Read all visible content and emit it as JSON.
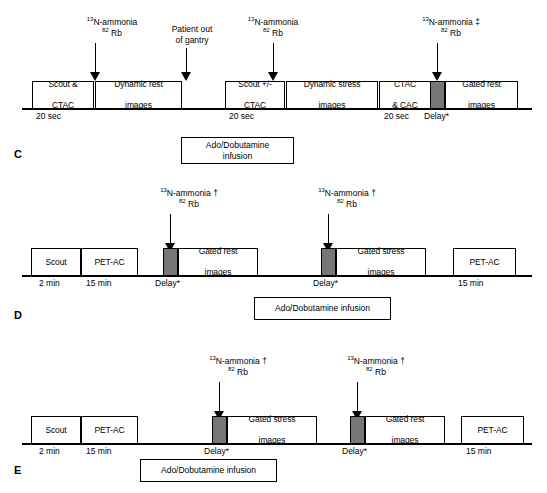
{
  "figure": {
    "panels": [
      "C",
      "D",
      "E"
    ],
    "ink_color": "#000000",
    "delay_block_color": "#767676",
    "background_color": "#ffffff"
  },
  "panel_c": {
    "letter": "C",
    "tracers": [
      {
        "id": "tracer-c1",
        "nuclide_sup": "13",
        "nuclide": "N-ammonia",
        "marker": "",
        "alt_sup": "82",
        "alt": "Rb"
      },
      {
        "id": "tracer-c2",
        "text_line1": "Patient out",
        "text_line2": "of gantry"
      },
      {
        "id": "tracer-c3",
        "nuclide_sup": "13",
        "nuclide": "N-ammonia",
        "marker": "",
        "alt_sup": "82",
        "alt": "Rb"
      },
      {
        "id": "tracer-c4",
        "nuclide_sup": "13",
        "nuclide": "N-ammonia",
        "marker": "‡",
        "alt_sup": "82",
        "alt": "Rb"
      }
    ],
    "steps": [
      {
        "id": "step-c-scout-ctac",
        "line1": "Scout &",
        "line2": "CTAC"
      },
      {
        "id": "step-c-dynamic-rest",
        "line1": "Dynamic rest",
        "line2": "images"
      },
      {
        "id": "step-c-scout-pm-ctac",
        "line1": "Scout +/-",
        "line2": "CTAC"
      },
      {
        "id": "step-c-dynamic-stress",
        "line1": "Dynamic stress",
        "line2": "images"
      },
      {
        "id": "step-c-ctac-cac",
        "line1": "CTAC",
        "line2": "& CAC"
      },
      {
        "id": "step-c-gated-rest",
        "line1": "Gated rest",
        "line2": "images"
      }
    ],
    "captions": [
      {
        "id": "caption-c-20sec-1",
        "text": "20 sec"
      },
      {
        "id": "caption-c-20sec-2",
        "text": "20 sec"
      },
      {
        "id": "caption-c-20sec-3",
        "text": "20 sec"
      },
      {
        "id": "caption-c-delay",
        "text": "Delay*"
      }
    ],
    "infusion": {
      "line1": "Ado/Dobutamine",
      "line2": "infusion"
    }
  },
  "panel_d": {
    "letter": "D",
    "tracers": [
      {
        "id": "tracer-d1",
        "nuclide_sup": "13",
        "nuclide": "N-ammonia",
        "marker": "†",
        "alt_sup": "82",
        "alt": "Rb"
      },
      {
        "id": "tracer-d2",
        "nuclide_sup": "13",
        "nuclide": "N-ammonia",
        "marker": "†",
        "alt_sup": "82",
        "alt": "Rb"
      }
    ],
    "steps": [
      {
        "id": "step-d-scout",
        "line1": "Scout",
        "line2": ""
      },
      {
        "id": "step-d-petac-1",
        "line1": "PET-AC",
        "line2": ""
      },
      {
        "id": "step-d-gated-rest",
        "line1": "Gated rest",
        "line2": "images"
      },
      {
        "id": "step-d-gated-stress",
        "line1": "Gated stress",
        "line2": "images"
      },
      {
        "id": "step-d-petac-2",
        "line1": "PET-AC",
        "line2": ""
      }
    ],
    "captions": [
      {
        "id": "caption-d-2min",
        "text": "2 min"
      },
      {
        "id": "caption-d-15min-1",
        "text": "15 min"
      },
      {
        "id": "caption-d-delay-1",
        "text": "Delay*"
      },
      {
        "id": "caption-d-delay-2",
        "text": "Delay*"
      },
      {
        "id": "caption-d-15min-2",
        "text": "15 min"
      }
    ],
    "infusion": {
      "line1": "Ado/Dobutamine infusion",
      "line2": ""
    }
  },
  "panel_e": {
    "letter": "E",
    "tracers": [
      {
        "id": "tracer-e1",
        "nuclide_sup": "13",
        "nuclide": "N-ammonia",
        "marker": "†",
        "alt_sup": "82",
        "alt": "Rb"
      },
      {
        "id": "tracer-e2",
        "nuclide_sup": "13",
        "nuclide": "N-ammonia",
        "marker": "†",
        "alt_sup": "82",
        "alt": "Rb"
      }
    ],
    "steps": [
      {
        "id": "step-e-scout",
        "line1": "Scout",
        "line2": ""
      },
      {
        "id": "step-e-petac-1",
        "line1": "PET-AC",
        "line2": ""
      },
      {
        "id": "step-e-gated-stress",
        "line1": "Gated stress",
        "line2": "images"
      },
      {
        "id": "step-e-gated-rest",
        "line1": "Gated rest",
        "line2": "images"
      },
      {
        "id": "step-e-petac-2",
        "line1": "PET-AC",
        "line2": ""
      }
    ],
    "captions": [
      {
        "id": "caption-e-2min",
        "text": "2 min"
      },
      {
        "id": "caption-e-15min-1",
        "text": "15 min"
      },
      {
        "id": "caption-e-delay-1",
        "text": "Delay*"
      },
      {
        "id": "caption-e-delay-2",
        "text": "Delay*"
      },
      {
        "id": "caption-e-15min-2",
        "text": "15 min"
      }
    ],
    "infusion": {
      "line1": "Ado/Dobutamine infusion",
      "line2": ""
    }
  }
}
